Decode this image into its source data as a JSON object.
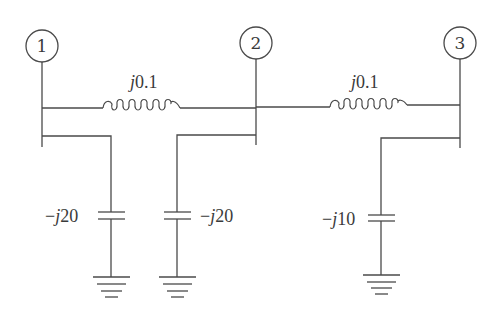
{
  "diagram": {
    "type": "power-system-single-line",
    "buses": [
      {
        "id": "1",
        "label": "1",
        "cx": 42,
        "cy": 46
      },
      {
        "id": "2",
        "label": "2",
        "cx": 256,
        "cy": 43
      },
      {
        "id": "3",
        "label": "3",
        "cx": 460,
        "cy": 43
      }
    ],
    "lines": [
      {
        "from": "1",
        "to": "2",
        "impedance_prefix": "j",
        "impedance_value": "0.1",
        "label": "j0.1"
      },
      {
        "from": "2",
        "to": "3",
        "impedance_prefix": "j",
        "impedance_value": "0.1",
        "label": "j0.1"
      }
    ],
    "shunts": [
      {
        "bus": "1",
        "sign": "−",
        "prefix": "j",
        "value": "20",
        "label": "−j20",
        "label_side": "left"
      },
      {
        "bus": "2",
        "sign": "−",
        "prefix": "j",
        "value": "20",
        "label": "−j20",
        "label_side": "right"
      },
      {
        "bus": "3",
        "sign": "−",
        "prefix": "j",
        "value": "10",
        "label": "−j10",
        "label_side": "left"
      }
    ],
    "colors": {
      "stroke": "#4a4a4a",
      "background": "#ffffff"
    }
  }
}
